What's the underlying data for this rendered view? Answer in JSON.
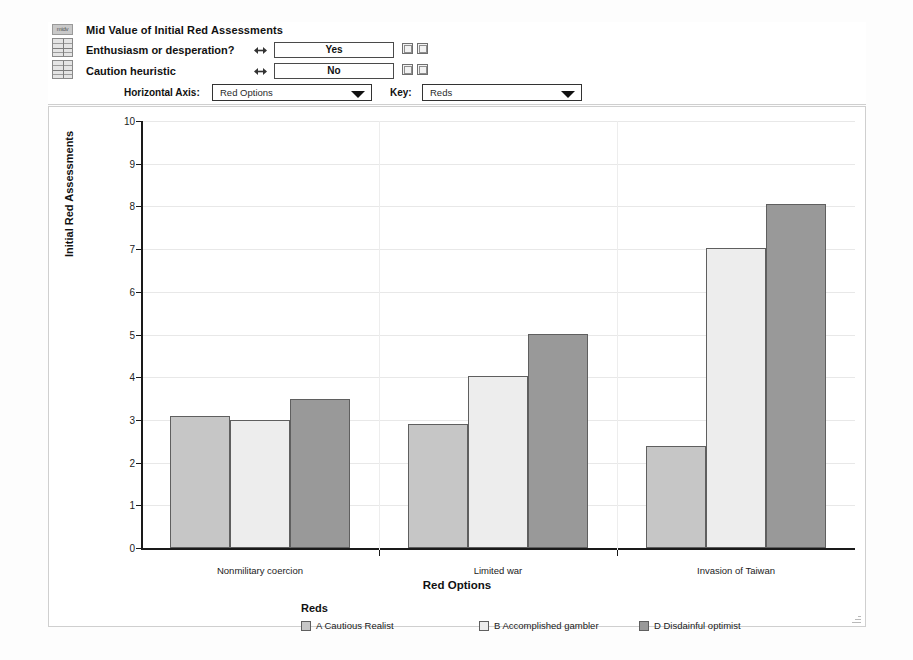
{
  "panel": {
    "title": "Mid Value of Initial Red Assessments",
    "icon_header_label": "midv",
    "icons": [
      "grid-icon-enthusiasm",
      "grid-icon-caution"
    ],
    "rows": [
      {
        "label": "Enthusiasm or desperation?",
        "value": "Yes",
        "spinner_icon": "left-right-spinner-icon",
        "buttons": [
          "link-button",
          "reset-button"
        ]
      },
      {
        "label": "Caution heuristic",
        "value": "No",
        "spinner_icon": "left-right-spinner-icon",
        "buttons": [
          "link-button",
          "reset-button"
        ]
      }
    ],
    "horizontal_axis": {
      "label": "Horizontal Axis:",
      "value": "Red Options",
      "options": [
        "Red Options"
      ]
    },
    "key": {
      "label": "Key:",
      "value": "Reds",
      "options": [
        "Reds"
      ]
    }
  },
  "chart_data": {
    "type": "bar",
    "title": "Mid Value of Initial Red Assessments",
    "xlabel": "Red Options",
    "ylabel": "Initial Red Assessments",
    "ylim": [
      0,
      10
    ],
    "yticks": [
      0,
      1,
      2,
      3,
      4,
      5,
      6,
      7,
      8,
      9,
      10
    ],
    "ytick_labels": [
      "0",
      "1",
      "2",
      "3",
      "4",
      "5",
      "6",
      "7",
      "8",
      "9",
      "10"
    ],
    "categories": [
      "Nonmilitary coercion",
      "Limited war",
      "Invasion of Taiwan"
    ],
    "grid": true,
    "legend_position": "bottom",
    "legend_title": "Reds",
    "series": [
      {
        "name": "A Cautious Realist",
        "color": "#c6c6c6",
        "values": [
          3.1,
          2.9,
          2.38
        ]
      },
      {
        "name": "B Accomplished gambler",
        "color": "#ededed",
        "values": [
          3.0,
          4.03,
          7.03
        ]
      },
      {
        "name": "D Disdainful optimist",
        "color": "#999999",
        "values": [
          3.5,
          5.02,
          8.05
        ]
      }
    ]
  }
}
